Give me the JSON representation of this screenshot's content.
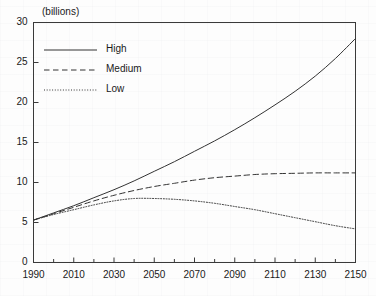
{
  "chart_data": {
    "type": "line",
    "title": "",
    "subtitle": "",
    "xlabel": "",
    "ylabel": "(billions)",
    "ylim": [
      0,
      30
    ],
    "xlim": [
      1990,
      2150
    ],
    "grid": false,
    "legend_position": "top-left",
    "y_ticks": [
      0,
      5,
      10,
      15,
      20,
      25,
      30
    ],
    "y_tick_labels": [
      "0",
      "5",
      "10",
      "15",
      "20",
      "25",
      "30"
    ],
    "x_ticks": [
      1990,
      2010,
      2030,
      2050,
      2070,
      2090,
      2110,
      2130,
      2150
    ],
    "x_tick_labels": [
      "1990",
      "2010",
      "2030",
      "2050",
      "2070",
      "2090",
      "2110",
      "2130",
      "2150"
    ],
    "x_minor_tick_interval": 10,
    "x": [
      1990,
      2000,
      2010,
      2020,
      2030,
      2040,
      2050,
      2060,
      2070,
      2080,
      2090,
      2100,
      2110,
      2120,
      2130,
      2140,
      2150
    ],
    "series": [
      {
        "name": "High",
        "style": "solid",
        "color": "#333333",
        "values": [
          5.3,
          6.2,
          7.1,
          8.1,
          9.1,
          10.2,
          11.4,
          12.6,
          13.9,
          15.2,
          16.6,
          18.1,
          19.7,
          21.4,
          23.3,
          25.5,
          28.0
        ]
      },
      {
        "name": "Medium",
        "style": "dashed",
        "color": "#333333",
        "values": [
          5.3,
          6.1,
          6.9,
          7.7,
          8.4,
          9.0,
          9.5,
          9.9,
          10.3,
          10.6,
          10.8,
          11.0,
          11.1,
          11.15,
          11.2,
          11.2,
          11.2
        ]
      },
      {
        "name": "Low",
        "style": "dotted",
        "color": "#333333",
        "values": [
          5.3,
          6.0,
          6.6,
          7.2,
          7.7,
          8.0,
          8.0,
          7.9,
          7.7,
          7.4,
          7.0,
          6.6,
          6.1,
          5.6,
          5.1,
          4.6,
          4.2
        ]
      }
    ]
  },
  "legend": {
    "items": [
      {
        "label": "High"
      },
      {
        "label": "Medium"
      },
      {
        "label": "Low"
      }
    ]
  },
  "axis": {
    "unit_label": "(billions)"
  }
}
